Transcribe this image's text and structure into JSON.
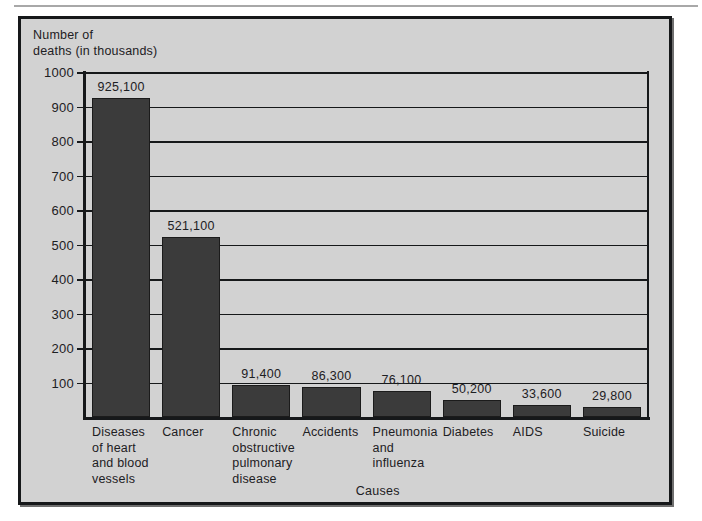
{
  "figure": {
    "background_color": "#d2d2d2",
    "border_color": "#16181a",
    "bar_color": "#3b3b3b"
  },
  "chart_data": {
    "type": "bar",
    "title": "",
    "ylabel": "Number of\ndeaths (in thousands)",
    "xlabel": "Causes",
    "categories": [
      "Diseases\nof heart\nand blood\nvessels",
      "Cancer",
      "Chronic\nobstructive\npulmonary\ndisease",
      "Accidents",
      "Pneumonia\nand\ninfluenza",
      "Diabetes",
      "AIDS",
      "Suicide"
    ],
    "values": [
      925.1,
      521.1,
      91.4,
      86.3,
      76.1,
      50.2,
      33.6,
      29.8
    ],
    "data_labels": [
      "925,100",
      "521,100",
      "91,400",
      "86,300",
      "76,100",
      "50,200",
      "33,600",
      "29,800"
    ],
    "ylim": [
      0,
      1000
    ],
    "ytick_labels": [
      "1000",
      "900",
      "800",
      "700",
      "600",
      "500",
      "400",
      "300",
      "200",
      "100"
    ],
    "ytick_values": [
      1000,
      900,
      800,
      700,
      600,
      500,
      400,
      300,
      200,
      100
    ],
    "grid": true,
    "legend": null,
    "units": "thousands of deaths"
  }
}
